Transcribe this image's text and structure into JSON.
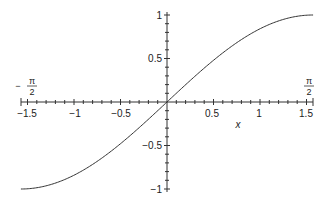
{
  "chart_data": {
    "type": "line",
    "title": "",
    "function": "sin(x)",
    "xlabel": "x",
    "ylabel": "",
    "xlim": [
      -1.5708,
      1.5708
    ],
    "ylim": [
      -1,
      1
    ],
    "grid": false,
    "legend": null,
    "x_ticks": [
      -1.5,
      -1,
      -0.5,
      0.5,
      1,
      1.5
    ],
    "x_tick_labels": [
      "-1.5",
      "-1",
      "-0.5",
      "0.5",
      "1",
      "1.5"
    ],
    "y_ticks": [
      -1,
      -0.5,
      0.5,
      1
    ],
    "y_tick_labels": [
      "-1",
      "-0.5",
      "0.5",
      "1"
    ],
    "annotations": [
      {
        "text": "-π/2",
        "x": -1.5708,
        "position": "above x-axis left end"
      },
      {
        "text": "π/2",
        "x": 1.5708,
        "position": "above x-axis right end"
      }
    ],
    "series": [
      {
        "name": "sin(x)",
        "color": "#333333",
        "x": [
          -1.5708,
          -1.5,
          -1.25,
          -1.0,
          -0.75,
          -0.5,
          -0.25,
          0,
          0.25,
          0.5,
          0.75,
          1.0,
          1.25,
          1.5,
          1.5708
        ],
        "y": [
          -1.0,
          -0.9975,
          -0.949,
          -0.8415,
          -0.6816,
          -0.4794,
          -0.2474,
          0,
          0.2474,
          0.4794,
          0.6816,
          0.8415,
          0.949,
          0.9975,
          1.0
        ]
      }
    ]
  },
  "labels": {
    "x_axis_title": "x",
    "left_end_minus": "−",
    "pi": "π",
    "two": "2",
    "x_ticks": [
      "−1.5",
      "−1",
      "−0.5",
      "0.5",
      "1",
      "1.5"
    ],
    "y_ticks": [
      "1",
      "0.5",
      "−0.5",
      "−1"
    ]
  },
  "colors": {
    "axis": "#333333",
    "curve": "#333333",
    "background": "#ffffff"
  }
}
